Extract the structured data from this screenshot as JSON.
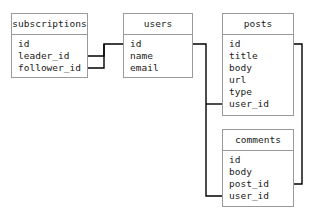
{
  "tables": {
    "subscriptions": {
      "title": "subscriptions",
      "fields": [
        "id",
        "leader_id",
        "follower_id"
      ]
    },
    "users": {
      "title": "users",
      "fields": [
        "id",
        "name",
        "email"
      ]
    },
    "posts": {
      "title": "posts",
      "fields": [
        "id",
        "title",
        "body",
        "url",
        "type",
        "user_id"
      ]
    },
    "comments": {
      "title": "comments",
      "fields": [
        "id",
        "body",
        "post_id",
        "user_id"
      ]
    }
  },
  "relationships": [
    {
      "from": "subscriptions.leader_id",
      "to": "users.id"
    },
    {
      "from": "subscriptions.follower_id",
      "to": "users.id"
    },
    {
      "from": "posts.user_id",
      "to": "users.id"
    },
    {
      "from": "comments.user_id",
      "to": "users.id"
    },
    {
      "from": "comments.post_id",
      "to": "posts.id"
    }
  ],
  "colors": {
    "border": "#9a9a9a",
    "line": "#000000"
  }
}
